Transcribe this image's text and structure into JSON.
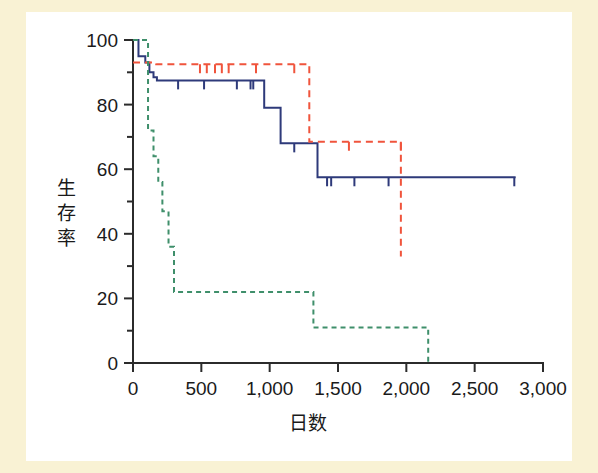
{
  "figure": {
    "background_color": "#f9f2d4",
    "plot_background_color": "#ffffff"
  },
  "chart_data": {
    "type": "line",
    "subtype": "kaplan-meier-survival-step",
    "title": "",
    "xlabel": "日数",
    "ylabel": "生存率",
    "xlim": [
      0,
      3000
    ],
    "ylim": [
      0,
      100
    ],
    "xticks": [
      0,
      500,
      1000,
      1500,
      2000,
      2500,
      3000
    ],
    "xtick_labels": [
      "0",
      "500",
      "1,000",
      "1,500",
      "2,000",
      "2,500",
      "3,000"
    ],
    "yticks": [
      0,
      20,
      40,
      60,
      80,
      100
    ],
    "ytick_labels": [
      "0",
      "20",
      "40",
      "60",
      "80",
      "100"
    ],
    "y_minor_ticks": [
      10,
      30,
      50,
      70,
      90
    ],
    "grid": false,
    "legend": "none",
    "series": [
      {
        "name": "blue-curve",
        "color": "#2e3a7a",
        "linestyle": "solid",
        "linewidth": 2,
        "points": [
          [
            0,
            100
          ],
          [
            40,
            100
          ],
          [
            40,
            95
          ],
          [
            90,
            95
          ],
          [
            90,
            93
          ],
          [
            120,
            93
          ],
          [
            120,
            90
          ],
          [
            150,
            90
          ],
          [
            150,
            88.5
          ],
          [
            175,
            88.5
          ],
          [
            175,
            87.5
          ],
          [
            960,
            87.5
          ],
          [
            960,
            79
          ],
          [
            1080,
            79
          ],
          [
            1080,
            68
          ],
          [
            1350,
            68
          ],
          [
            1350,
            57.5
          ],
          [
            2800,
            57.5
          ]
        ],
        "censor_times": [
          330,
          520,
          760,
          860,
          880,
          1180,
          1420,
          1450,
          1620,
          1870,
          2790
        ],
        "censor_values": [
          87.5,
          87.5,
          87.5,
          87.5,
          87.5,
          68,
          57.5,
          57.5,
          57.5,
          57.5,
          57.5
        ]
      },
      {
        "name": "red-curve",
        "color": "#f0543c",
        "linestyle": "dashed",
        "linewidth": 2,
        "points": [
          [
            0,
            93
          ],
          [
            170,
            93
          ],
          [
            170,
            92.5
          ],
          [
            1290,
            92.5
          ],
          [
            1290,
            68.5
          ],
          [
            1960,
            68.5
          ],
          [
            1960,
            33
          ]
        ],
        "censor_times": [
          490,
          540,
          600,
          650,
          700,
          900,
          1180,
          1580,
          1960
        ],
        "censor_values": [
          92.5,
          92.5,
          92.5,
          92.5,
          92.5,
          92.5,
          92.5,
          68.5,
          68.5
        ]
      },
      {
        "name": "green-curve",
        "color": "#3f8f6b",
        "linestyle": "dotted",
        "linewidth": 2,
        "points": [
          [
            0,
            100
          ],
          [
            110,
            100
          ],
          [
            110,
            72
          ],
          [
            150,
            72
          ],
          [
            150,
            64
          ],
          [
            185,
            64
          ],
          [
            185,
            56
          ],
          [
            215,
            56
          ],
          [
            215,
            47
          ],
          [
            260,
            47
          ],
          [
            260,
            36
          ],
          [
            300,
            36
          ],
          [
            300,
            22
          ],
          [
            1320,
            22
          ],
          [
            1320,
            11
          ],
          [
            2160,
            11
          ],
          [
            2160,
            0
          ]
        ],
        "censor_times": [],
        "censor_values": []
      }
    ]
  }
}
